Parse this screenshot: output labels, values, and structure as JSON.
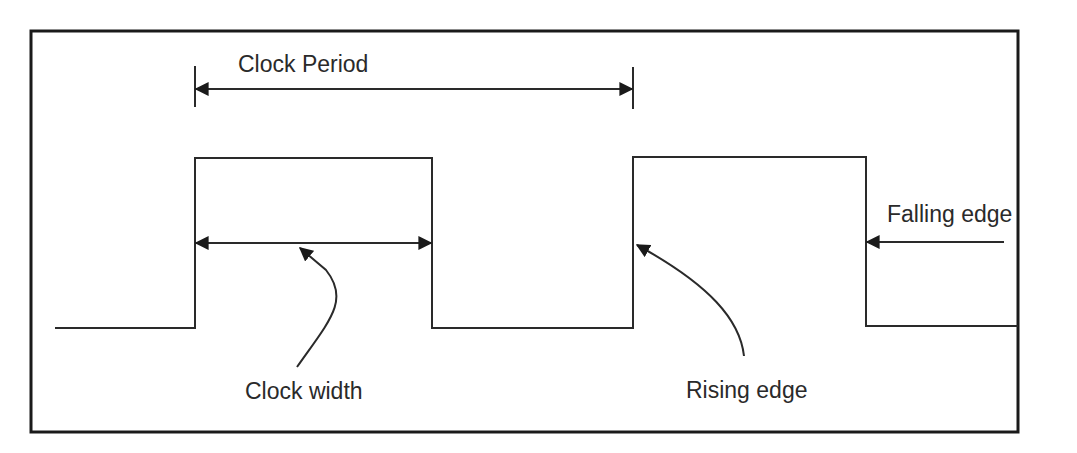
{
  "diagram": {
    "type": "clock-signal-timing-diagram",
    "labels": {
      "clock_period": "Clock Period",
      "clock_width": "Clock width",
      "rising_edge": "Rising edge",
      "falling_edge": "Falling edge"
    },
    "colors": {
      "line": "#2a2a2a",
      "frame": "#1a1a1a",
      "background": "#ffffff"
    },
    "signal": {
      "low_level": "low",
      "high_level": "high",
      "pulses": 2
    }
  }
}
